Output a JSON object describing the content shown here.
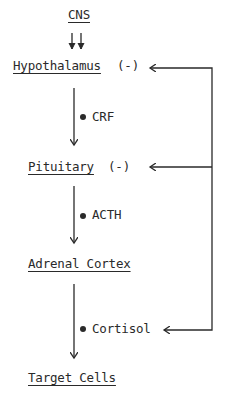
{
  "diagram": {
    "type": "flowchart",
    "nodes": [
      {
        "id": "cns",
        "label": "CNS"
      },
      {
        "id": "hypothalamus",
        "label": "Hypothalamus",
        "feedback_sign": "(-)"
      },
      {
        "id": "pituitary",
        "label": "Pituitary",
        "feedback_sign": "(-)"
      },
      {
        "id": "adrenal",
        "label": "Adrenal Cortex"
      },
      {
        "id": "target",
        "label": "Target Cells"
      }
    ],
    "signals": [
      {
        "from": "hypothalamus",
        "to": "pituitary",
        "label": "CRF"
      },
      {
        "from": "pituitary",
        "to": "adrenal",
        "label": "ACTH"
      },
      {
        "from": "adrenal",
        "to": "target",
        "label": "Cortisol"
      }
    ],
    "feedback": {
      "from": "Cortisol",
      "to": [
        "Hypothalamus",
        "Pituitary"
      ]
    },
    "colors": {
      "ink": "#2a2a2a",
      "background": "#ffffff"
    }
  }
}
